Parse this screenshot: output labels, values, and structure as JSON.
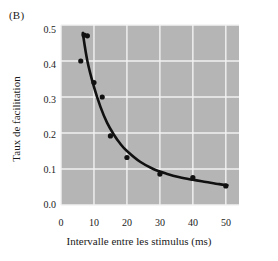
{
  "figure": {
    "panel_label": "(B)",
    "background_color": "#ffffff",
    "plot_background_color": "#b5b5b5",
    "gridline_color": "#f2f2f2",
    "marker_color": "#111111",
    "curve_color": "#111111"
  },
  "axes": {
    "y_title": "Taux de facilitation",
    "x_title": "Intervalle entre les stimulus (ms)",
    "y_ticks": [
      "0.0",
      "0.1",
      "0.2",
      "0.3",
      "0.4",
      "0.5"
    ],
    "x_ticks": [
      "0",
      "10",
      "20",
      "30",
      "40",
      "50"
    ]
  },
  "chart_data": {
    "type": "scatter",
    "title": "(B)",
    "xlabel": "Intervalle entre les stimulus (ms)",
    "ylabel": "Taux de facilitation",
    "xlim": [
      0,
      54
    ],
    "ylim": [
      0.0,
      0.5
    ],
    "xticks": [
      0,
      10,
      20,
      30,
      40,
      50
    ],
    "yticks": [
      0.0,
      0.1,
      0.2,
      0.3,
      0.4,
      0.5
    ],
    "grid": true,
    "legend": null,
    "series": [
      {
        "name": "Taux de facilitation mesuré",
        "type": "scatter",
        "x": [
          6,
          7,
          8,
          10,
          12.5,
          15,
          20,
          30,
          40,
          50
        ],
        "y": [
          0.4,
          0.472,
          0.47,
          0.34,
          0.3,
          0.192,
          0.132,
          0.086,
          0.076,
          0.053
        ]
      },
      {
        "name": "Courbe d'ajustement exponentielle",
        "type": "line",
        "x": [
          6.6,
          8,
          10,
          12,
          14,
          16,
          18,
          20,
          24,
          28,
          32,
          36,
          40,
          44,
          48,
          50.5
        ],
        "y": [
          0.478,
          0.4,
          0.328,
          0.272,
          0.228,
          0.196,
          0.17,
          0.15,
          0.12,
          0.1,
          0.087,
          0.077,
          0.07,
          0.064,
          0.058,
          0.055
        ]
      }
    ]
  }
}
